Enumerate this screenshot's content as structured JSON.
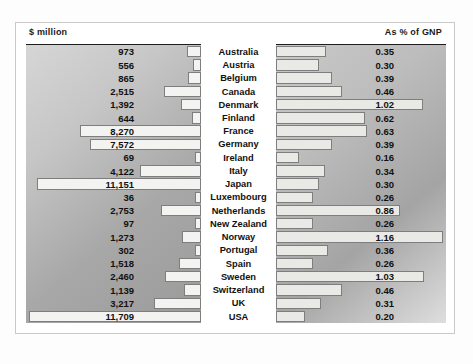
{
  "header": {
    "left_label": "$ million",
    "right_label": "As % of GNP"
  },
  "colors": {
    "frame": "#c9c9c9",
    "rule": "#1d1d1d",
    "bar_fill": "#f3f3f1",
    "bar_stroke": "#7e7e7e",
    "text": "#111111",
    "panel_left_bg": "#b4b4b4",
    "panel_right_bg": "#b4b4b4"
  },
  "chart_data": {
    "type": "bar",
    "title": "",
    "subtitle": "",
    "orientation": "horizontal",
    "layout": "paired back-to-back bars with central country labels",
    "categories": [
      "Australia",
      "Austria",
      "Belgium",
      "Canada",
      "Denmark",
      "Finland",
      "France",
      "Germany",
      "Ireland",
      "Italy",
      "Japan",
      "Luxembourg",
      "Netherlands",
      "New Zealand",
      "Norway",
      "Portugal",
      "Spain",
      "Sweden",
      "Switzerland",
      "UK",
      "USA"
    ],
    "series": [
      {
        "name": "$ million",
        "axis": "left",
        "direction": "right-to-left",
        "xlabel": "$ million",
        "xlim": [
          0,
          11709
        ],
        "values": [
          973,
          556,
          865,
          2515,
          1392,
          644,
          8270,
          7572,
          69,
          4122,
          11151,
          36,
          2753,
          97,
          1273,
          302,
          1518,
          2460,
          1139,
          3217,
          11709
        ],
        "labels": [
          "973",
          "556",
          "865",
          "2,515",
          "1,392",
          "644",
          "8,270",
          "7,572",
          "69",
          "4,122",
          "11,151",
          "36",
          "2,753",
          "97",
          "1,273",
          "302",
          "1,518",
          "2,460",
          "1,139",
          "3,217",
          "11,709"
        ]
      },
      {
        "name": "As % of GNP",
        "axis": "right",
        "direction": "left-to-right",
        "xlabel": "As % of GNP",
        "xlim": [
          0,
          1.16
        ],
        "values": [
          0.35,
          0.3,
          0.39,
          0.46,
          1.02,
          0.62,
          0.63,
          0.39,
          0.16,
          0.34,
          0.3,
          0.26,
          0.86,
          0.26,
          1.16,
          0.36,
          0.26,
          1.03,
          0.46,
          0.31,
          0.2
        ],
        "labels": [
          "0.35",
          "0.30",
          "0.39",
          "0.46",
          "1.02",
          "0.62",
          "0.63",
          "0.39",
          "0.16",
          "0.34",
          "0.30",
          "0.26",
          "0.86",
          "0.26",
          "1.16",
          "0.36",
          "0.26",
          "1.03",
          "0.46",
          "0.31",
          "0.20"
        ]
      }
    ],
    "grid": false,
    "legend": false
  }
}
